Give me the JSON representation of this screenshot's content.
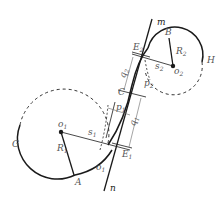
{
  "diagram": {
    "type": "reverse-curve geometry (two arcs joined by transition along tangent line m–n)",
    "colors": {
      "line": "#1a1a1a",
      "label": "#555555",
      "background": "#ffffff"
    },
    "lines": {
      "m": "m",
      "n": "n"
    },
    "points": {
      "A": "A",
      "B": "B",
      "C": "C",
      "E1": "E",
      "E1_sub": "1",
      "E2": "E",
      "E2_sub": "2",
      "G": "G",
      "H": "H",
      "o1": "o",
      "o1_sub": "1",
      "o2": "o",
      "o2_sub": "2",
      "o1_tangent": "o",
      "o1_tangent_sub": "1"
    },
    "dimensions": {
      "R1": "R",
      "R1_sub": "1",
      "R2": "R",
      "R2_sub": "2",
      "s1": "s",
      "s1_sub": "1",
      "s2": "s",
      "s2_sub": "2",
      "p1": "p",
      "p1_sub": "1",
      "p2": "p",
      "p2_sub": "2",
      "q1": "q",
      "q1_sub": "1",
      "q2": "q",
      "q2_sub": "2"
    }
  }
}
